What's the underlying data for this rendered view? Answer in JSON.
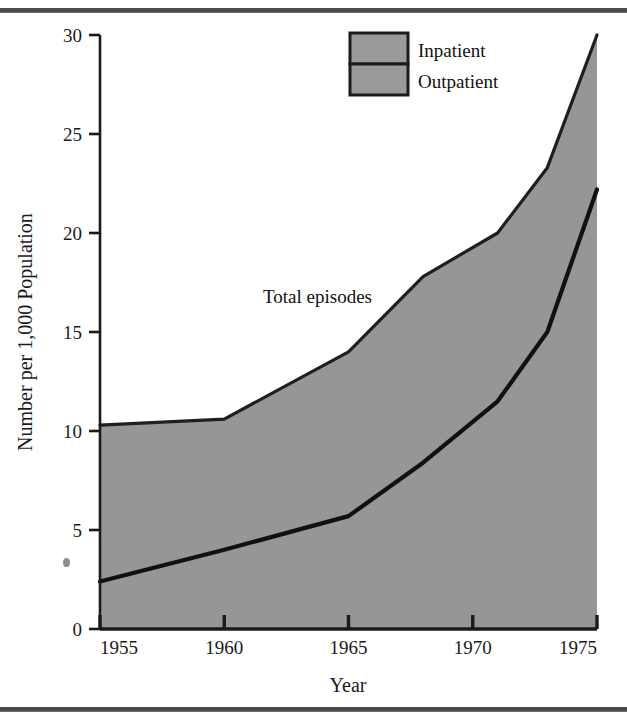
{
  "figure": {
    "background_color": "#ffffff",
    "rule_color": "#4a4a4a",
    "fill_color": "#969696",
    "line_color": "#111111"
  },
  "legend": {
    "position": "top-center-right",
    "items": [
      {
        "label": "Inpatient",
        "swatch_color": "#9a9a9a",
        "border_color": "#1a1a1a"
      },
      {
        "label": "Outpatient",
        "swatch_color": "#9a9a9a",
        "border_color": "#1a1a1a"
      }
    ]
  },
  "annotations": [
    {
      "text": "Total episodes",
      "x_value": 1963.0,
      "y_value": 17.2
    }
  ],
  "axes": {
    "x": {
      "title": "Year",
      "min": 1955,
      "max": 1975,
      "ticks": [
        1955,
        1960,
        1965,
        1970,
        1975
      ],
      "tick_labels": [
        "1955",
        "1960",
        "1965",
        "1970",
        "1975"
      ]
    },
    "y": {
      "title": "Number per 1,000 Population",
      "min": 0,
      "max": 30,
      "ticks": [
        0,
        5,
        10,
        15,
        20,
        25,
        30
      ],
      "tick_labels": [
        "0",
        "5",
        "10",
        "15",
        "20",
        "25",
        "30"
      ]
    }
  },
  "chart_data": {
    "type": "area",
    "title": "",
    "subtitle": "",
    "xlabel": "Year",
    "ylabel": "Number per 1,000 Population",
    "xlim": [
      1955,
      1975
    ],
    "ylim": [
      0,
      30
    ],
    "grid": false,
    "legend_position": "top-center-right",
    "stacked": true,
    "annotations": [
      "Total episodes"
    ],
    "x": [
      1955,
      1960,
      1965,
      1968,
      1971,
      1973,
      1975
    ],
    "series": [
      {
        "name": "Outpatient",
        "description": "Lower band: outpatient episodes, area between zero and the lower curve",
        "boundary_name": "outpatient-upper-boundary",
        "values": [
          2.4,
          4.0,
          5.7,
          8.4,
          11.5,
          15.0,
          22.2
        ]
      },
      {
        "name": "Inpatient",
        "description": "Upper band: inpatient episodes, area between lower curve and total episodes curve",
        "boundary_name": "total-episodes-boundary",
        "values": [
          7.9,
          6.6,
          8.3,
          9.4,
          8.5,
          8.3,
          7.8
        ]
      }
    ],
    "total_episodes": {
      "name": "Total episodes",
      "x": [
        1955,
        1960,
        1965,
        1968,
        1971,
        1973,
        1975
      ],
      "values": [
        10.3,
        10.6,
        14.0,
        17.8,
        20.0,
        23.3,
        30.0
      ]
    }
  }
}
